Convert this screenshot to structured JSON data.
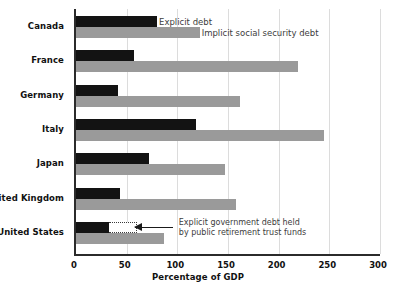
{
  "chart_data": {
    "type": "bar",
    "orientation": "horizontal",
    "title": "",
    "xlabel": "Percentage of GDP",
    "ylabel": "",
    "xlim": [
      0,
      300
    ],
    "xticks": [
      0,
      50,
      100,
      150,
      200,
      250,
      300
    ],
    "grid": true,
    "grid_axis": "x",
    "legend_position": "inline-first-group",
    "categories": [
      "Canada",
      "France",
      "Germany",
      "Italy",
      "Japan",
      "United Kingdom",
      "United States"
    ],
    "series": [
      {
        "name": "Explicit debt",
        "color": "#131313",
        "values": [
          80,
          57,
          41,
          118,
          72,
          43,
          33
        ]
      },
      {
        "name": "Implicit social security debt",
        "color": "#9a9a9a",
        "values": [
          122,
          219,
          162,
          245,
          147,
          158,
          87
        ]
      },
      {
        "name": "Explicit government debt held by public retirement trust funds",
        "color": "#ffffff",
        "style": "dotted-outline",
        "stacked_on": "Explicit debt",
        "values": [
          null,
          null,
          null,
          null,
          null,
          null,
          27
        ]
      }
    ],
    "annotations": [
      {
        "text_line_1": "Explicit government debt held",
        "text_line_2": "by public retirement trust funds",
        "target_category": "United States",
        "target_series": "Explicit government debt held by public retirement trust funds"
      }
    ]
  },
  "legend": {
    "explicit_label": "Explicit debt",
    "implicit_label": "Implicit social security debt"
  },
  "axis": {
    "title": "Percentage of GDP",
    "tick_labels": [
      "0",
      "50",
      "100",
      "150",
      "200",
      "250",
      "300"
    ]
  },
  "colors": {
    "explicit": "#131313",
    "implicit": "#9a9a9a",
    "axis": "#2b2b2b",
    "grid": "#dcdcdc",
    "text": "#111111",
    "annotation_text": "#3d3d3d"
  }
}
